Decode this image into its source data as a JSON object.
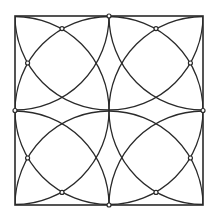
{
  "diagram": {
    "stroke_color": "#2a2a2a",
    "background": "#ffffff",
    "grid_divisions": 2,
    "arc_centers": "all grid points (corners, edge midpoints, center)",
    "arc_radius_fraction_of_side": 0.5,
    "marked_points_count": 12
  }
}
